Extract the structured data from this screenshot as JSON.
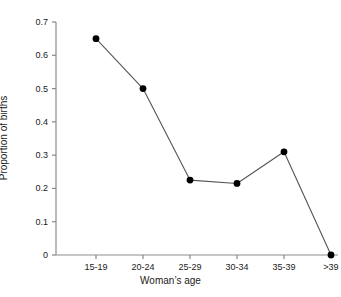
{
  "chart_data": {
    "type": "line",
    "title": "",
    "xlabel": "Woman’s age",
    "ylabel": "Proportion of births",
    "categories": [
      "15-19",
      "20-24",
      "25-29",
      "30-34",
      "35-39",
      ">39"
    ],
    "values": [
      0.65,
      0.5,
      0.225,
      0.215,
      0.31,
      0.0
    ],
    "ylim": [
      0,
      0.7
    ],
    "yticks": [
      0,
      0.1,
      0.2,
      0.3,
      0.4,
      0.5,
      0.6,
      0.7
    ],
    "ytick_labels": [
      "0",
      "0.1",
      "0.2",
      "0.3",
      "0.4",
      "0.5",
      "0.6",
      "0.7"
    ],
    "grid": false,
    "legend": "none",
    "marker": "filled-circle",
    "colors": {
      "line": "#555555",
      "marker": "#000000",
      "axis": "#888888",
      "text": "#1a1a1a",
      "background": "#ffffff"
    }
  }
}
